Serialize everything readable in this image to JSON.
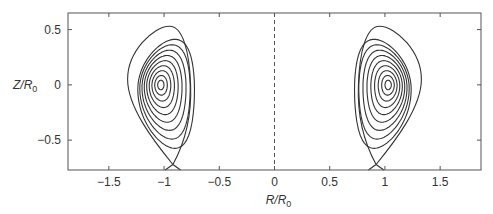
{
  "chart_data": {
    "type": "line",
    "title": "",
    "xlabel": "R/R0",
    "ylabel": "Z/R0",
    "xlabel_parts": {
      "main": "R/R",
      "sub": "0"
    },
    "ylabel_parts": {
      "main": "Z/R",
      "sub": "0"
    },
    "xlim": [
      -1.87,
      1.87
    ],
    "ylim": [
      -0.77,
      0.65
    ],
    "xticks": [
      -1.5,
      -1,
      -0.5,
      0,
      0.5,
      1,
      1.5
    ],
    "xtick_labels": [
      "−1.5",
      "−1",
      "−0.5",
      "0",
      "0.5",
      "1",
      "1.5"
    ],
    "yticks": [
      0.5,
      0,
      -0.5
    ],
    "ytick_labels": [
      "0.5",
      "0",
      "−0.5"
    ],
    "grid": false,
    "legend": null,
    "annotations": [
      {
        "type": "dashed_vline",
        "x": 0
      }
    ],
    "series": [
      {
        "name": "flux-surfaces-right",
        "magnetic_axis": [
          1.03,
          0.0
        ],
        "x_point": [
          0.92,
          -0.72
        ],
        "outer_extent": {
          "r_min": 0.76,
          "r_max": 1.33,
          "z_max": 0.53,
          "z_min": -0.77
        },
        "n_contours": 10
      },
      {
        "name": "flux-surfaces-left",
        "magnetic_axis": [
          -1.03,
          0.0
        ],
        "x_point": [
          -0.92,
          -0.72
        ],
        "outer_extent": {
          "r_min": -1.33,
          "r_max": -0.76,
          "z_max": 0.53,
          "z_min": -0.77
        },
        "n_contours": 10
      }
    ],
    "line_color": "#333333"
  }
}
